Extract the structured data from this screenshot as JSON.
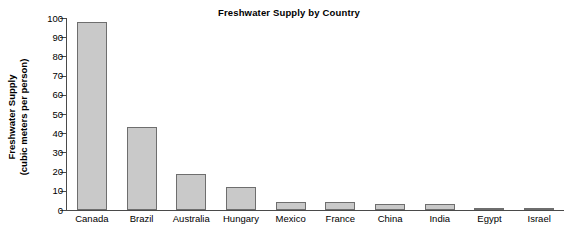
{
  "chart_data": {
    "type": "bar",
    "title": "Freshwater Supply by Country",
    "xlabel": "",
    "ylabel": "Freshwater Supply (cubic meters per person)",
    "ylabel_lines": [
      "Freshwater Supply",
      "(cubic meters per person)"
    ],
    "categories": [
      "Canada",
      "Brazil",
      "Australia",
      "Hungary",
      "Mexico",
      "France",
      "China",
      "India",
      "Egypt",
      "Israel"
    ],
    "values": [
      98,
      43,
      19,
      12,
      4,
      4,
      3,
      3,
      1,
      0.3
    ],
    "ylim": [
      0,
      100
    ],
    "ytick_values": [
      0,
      10,
      20,
      30,
      40,
      50,
      60,
      70,
      80,
      90,
      100
    ],
    "ytick_labels": [
      "0",
      "10",
      "20",
      "30",
      "40",
      "50",
      "60",
      "70",
      "80",
      "90",
      "100"
    ],
    "grid": false,
    "legend": false,
    "bar_fill_color": "#c9c9c9",
    "bar_edge_color": "#6e6e6e",
    "axis_color": "#4a4a4a",
    "text_color": "#000000"
  },
  "source": {
    "text": ""
  }
}
